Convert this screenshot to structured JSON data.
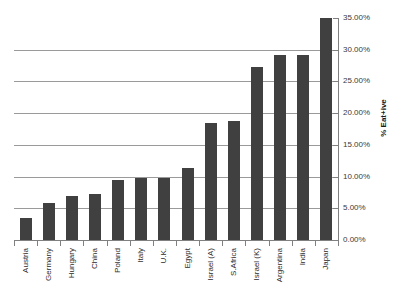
{
  "chart_data": {
    "type": "bar",
    "title": "",
    "subtitle": "",
    "xlabel": "",
    "ylabel": "% Eat+ive",
    "ylim": [
      0,
      35
    ],
    "ytick_step": 5,
    "grid": true,
    "legend": false,
    "bar_color": "#404040",
    "gridline_color": "#9a9a9a",
    "axis_color": "#808080",
    "ytick_labels": [
      "0.00%",
      "5.00%",
      "10.00%",
      "15.00%",
      "20.00%",
      "25.00%",
      "30.00%",
      "35.00%"
    ],
    "ytick_values": [
      0,
      5,
      10,
      15,
      20,
      25,
      30,
      35
    ],
    "categories": [
      "Austria",
      "Germany",
      "Hungary",
      "China",
      "Poland",
      "Italy",
      "U.K.",
      "Egypt",
      "Israel (A)",
      "S.Africa",
      "Israel (K)",
      "Argentina",
      "India",
      "Japan"
    ],
    "values": [
      3.5,
      5.8,
      6.9,
      7.3,
      9.4,
      9.7,
      9.7,
      11.3,
      18.4,
      18.8,
      27.3,
      29.2,
      29.2,
      35.0
    ],
    "value_labels": [
      "3.50%",
      "5.80%",
      "6.90%",
      "7.30%",
      "9.40%",
      "9.70%",
      "9.70%",
      "11.30%",
      "18.40%",
      "18.80%",
      "27.30%",
      "29.20%",
      "29.20%",
      "35.00%"
    ]
  }
}
